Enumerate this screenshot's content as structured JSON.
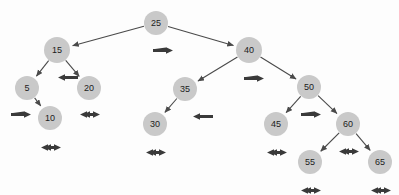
{
  "diagram": {
    "type": "binary-search-tree",
    "node_fill": "#c9c9c9",
    "node_text_color": "#1c1c1c",
    "edge_color": "#4a4a4a",
    "arrow_color": "#3a3a3a",
    "background": "#fdfdfd",
    "node_radius": 12,
    "nodes": [
      {
        "id": "n25",
        "label": "25",
        "cx": 156,
        "cy": 23,
        "r": 12,
        "arrow": "right",
        "arrow_x": 152,
        "arrow_y": 41
      },
      {
        "id": "n15",
        "label": "15",
        "cx": 57,
        "cy": 50,
        "r": 13,
        "arrow": "left",
        "arrow_x": 57,
        "arrow_y": 68
      },
      {
        "id": "n40",
        "label": "40",
        "cx": 249,
        "cy": 50,
        "r": 13,
        "arrow": "right",
        "arrow_x": 243,
        "arrow_y": 69
      },
      {
        "id": "n5",
        "label": "5",
        "cx": 27,
        "cy": 88,
        "r": 12,
        "arrow": "right",
        "arrow_x": 10,
        "arrow_y": 105
      },
      {
        "id": "n20",
        "label": "20",
        "cx": 89,
        "cy": 88,
        "r": 12,
        "arrow": "double",
        "arrow_x": 79,
        "arrow_y": 105
      },
      {
        "id": "n35",
        "label": "35",
        "cx": 185,
        "cy": 89,
        "r": 12,
        "arrow": "left",
        "arrow_x": 192,
        "arrow_y": 107
      },
      {
        "id": "n50",
        "label": "50",
        "cx": 309,
        "cy": 87,
        "r": 12,
        "arrow": "right",
        "arrow_x": 300,
        "arrow_y": 105
      },
      {
        "id": "n10",
        "label": "10",
        "cx": 50,
        "cy": 118,
        "r": 12,
        "arrow": "double",
        "arrow_x": 40,
        "arrow_y": 138
      },
      {
        "id": "n30",
        "label": "30",
        "cx": 155,
        "cy": 124,
        "r": 12,
        "arrow": "double",
        "arrow_x": 145,
        "arrow_y": 143
      },
      {
        "id": "n45",
        "label": "45",
        "cx": 276,
        "cy": 124,
        "r": 12,
        "arrow": "double",
        "arrow_x": 266,
        "arrow_y": 143
      },
      {
        "id": "n60",
        "label": "60",
        "cx": 348,
        "cy": 124,
        "r": 12,
        "arrow": "double",
        "arrow_x": 338,
        "arrow_y": 142
      },
      {
        "id": "n55",
        "label": "55",
        "cx": 310,
        "cy": 162,
        "r": 12,
        "arrow": "double",
        "arrow_x": 300,
        "arrow_y": 181
      },
      {
        "id": "n65",
        "label": "65",
        "cx": 380,
        "cy": 162,
        "r": 12,
        "arrow": "double",
        "arrow_x": 370,
        "arrow_y": 181
      }
    ],
    "edges": [
      {
        "from": "n25",
        "to": "n15",
        "direction": "left"
      },
      {
        "from": "n25",
        "to": "n40",
        "direction": "right"
      },
      {
        "from": "n15",
        "to": "n5",
        "direction": "left"
      },
      {
        "from": "n15",
        "to": "n20",
        "direction": "right"
      },
      {
        "from": "n5",
        "to": "n10",
        "direction": "right"
      },
      {
        "from": "n40",
        "to": "n35",
        "direction": "left"
      },
      {
        "from": "n40",
        "to": "n50",
        "direction": "right"
      },
      {
        "from": "n35",
        "to": "n30",
        "direction": "left"
      },
      {
        "from": "n50",
        "to": "n45",
        "direction": "left"
      },
      {
        "from": "n50",
        "to": "n60",
        "direction": "right"
      },
      {
        "from": "n60",
        "to": "n55",
        "direction": "left"
      },
      {
        "from": "n60",
        "to": "n65",
        "direction": "right"
      }
    ],
    "arrow_legend": {
      "right": "right-arrow-icon",
      "left": "left-arrow-icon",
      "double": "double-headed-arrow-icon"
    }
  }
}
